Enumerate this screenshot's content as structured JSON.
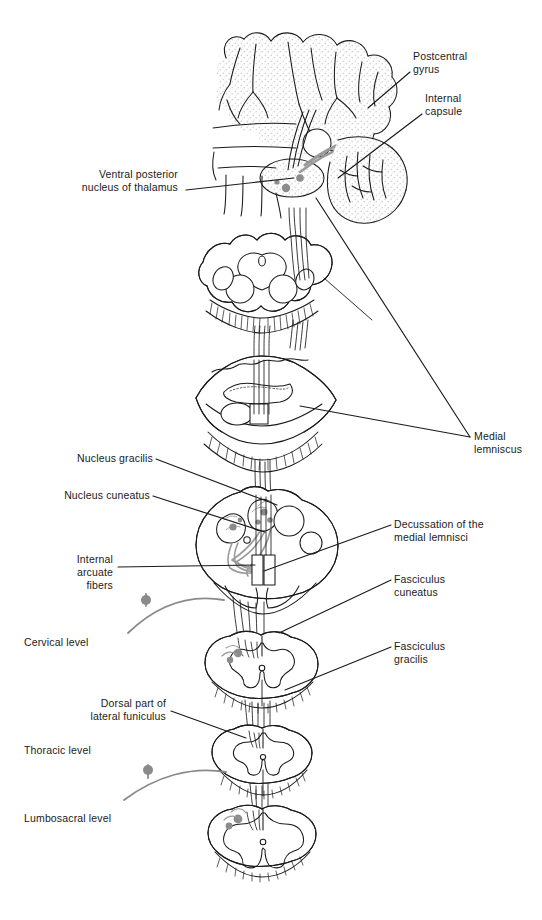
{
  "figure": {
    "width": 542,
    "height": 920,
    "background_color": "#ffffff",
    "ink_color": "#1a1a1a",
    "gray_fiber_color": "#8a8a8a",
    "stipple_color": "#d9d9d9"
  },
  "labels": [
    {
      "id": "postcentral-gyrus",
      "text": "Postcentral\ngyrus",
      "x": 413,
      "y": 50,
      "align": "left",
      "leader": {
        "x1": 410,
        "y1": 72,
        "x2": 368,
        "y2": 108
      }
    },
    {
      "id": "internal-capsule",
      "text": "Internal\ncapsule",
      "x": 425,
      "y": 92,
      "align": "left",
      "leader": {
        "x1": 422,
        "y1": 114,
        "x2": 338,
        "y2": 178
      }
    },
    {
      "id": "ventral-posterior-nucleus-of-thalamus",
      "text": "Ventral posterior\nnucleus of thalamus",
      "x": 178,
      "y": 168,
      "align": "right",
      "leader": {
        "x1": 186,
        "y1": 190,
        "x2": 294,
        "y2": 178
      }
    },
    {
      "id": "medial-lemniscus",
      "text": "Medial\nlemniscus",
      "x": 474,
      "y": 430,
      "align": "left",
      "leader": {
        "x1": 470,
        "y1": 437,
        "x2": 316,
        "y2": 198
      },
      "leader2": {
        "x1": 470,
        "y1": 437,
        "x2": 300,
        "y2": 406
      }
    },
    {
      "id": "nucleus-gracilis",
      "text": "Nucleus gracilis",
      "x": 153,
      "y": 452,
      "align": "right",
      "leader": {
        "x1": 156,
        "y1": 459,
        "x2": 277,
        "y2": 505
      }
    },
    {
      "id": "nucleus-cuneatus",
      "text": "Nucleus cuneatus",
      "x": 150,
      "y": 489,
      "align": "right",
      "leader": {
        "x1": 153,
        "y1": 496,
        "x2": 265,
        "y2": 532
      }
    },
    {
      "id": "internal-arcuate-fibers",
      "text": "Internal\narcuate\nfibers",
      "x": 113,
      "y": 553,
      "align": "right",
      "leader": {
        "x1": 118,
        "y1": 567,
        "x2": 255,
        "y2": 565
      }
    },
    {
      "id": "decussation-of-the-medial-lemnisci",
      "text": "Decussation of the\nmedial lemnisci",
      "x": 394,
      "y": 518,
      "align": "left",
      "leader": {
        "x1": 391,
        "y1": 525,
        "x2": 264,
        "y2": 571
      }
    },
    {
      "id": "fasciculus-cuneatus",
      "text": "Fasciculus\ncuneatus",
      "x": 394,
      "y": 573,
      "align": "left",
      "leader": {
        "x1": 391,
        "y1": 580,
        "x2": 279,
        "y2": 633
      }
    },
    {
      "id": "fasciculus-gracilis",
      "text": "Fasciculus\ngracilis",
      "x": 394,
      "y": 640,
      "align": "left",
      "leader": {
        "x1": 391,
        "y1": 647,
        "x2": 285,
        "y2": 690
      }
    },
    {
      "id": "dorsal-part-of-lateral-funiculus",
      "text": "Dorsal part of\nlateral funiculus",
      "x": 166,
      "y": 697,
      "align": "right",
      "leader": {
        "x1": 171,
        "y1": 711,
        "x2": 246,
        "y2": 738
      }
    },
    {
      "id": "cervical-level",
      "text": "Cervical level",
      "x": 24,
      "y": 636,
      "align": "left",
      "leader": null
    },
    {
      "id": "thoracic-level",
      "text": "Thoracic level",
      "x": 24,
      "y": 744,
      "align": "left",
      "leader": null
    },
    {
      "id": "lumbosacral-level",
      "text": "Lumbosacral level",
      "x": 24,
      "y": 812,
      "align": "left",
      "leader": null
    }
  ],
  "sections": [
    {
      "id": "cerebral-hemisphere",
      "name": "Cerebral hemisphere with postcentral gyrus and internal capsule",
      "cx": 300,
      "cy": 130
    },
    {
      "id": "midbrain",
      "name": "Midbrain cross section",
      "cx": 260,
      "cy": 285
    },
    {
      "id": "pons",
      "name": "Pons cross section",
      "cx": 258,
      "cy": 398
    },
    {
      "id": "medulla",
      "name": "Medulla oblongata cross section",
      "cx": 266,
      "cy": 545
    },
    {
      "id": "spinal-cord-cervical",
      "name": "Cervical spinal cord cross section",
      "cx": 264,
      "cy": 663
    },
    {
      "id": "spinal-cord-thoracic",
      "name": "Thoracic spinal cord cross section",
      "cx": 263,
      "cy": 752
    },
    {
      "id": "spinal-cord-lumbosacral",
      "name": "Lumbosacral spinal cord cross section",
      "cx": 262,
      "cy": 833
    }
  ]
}
